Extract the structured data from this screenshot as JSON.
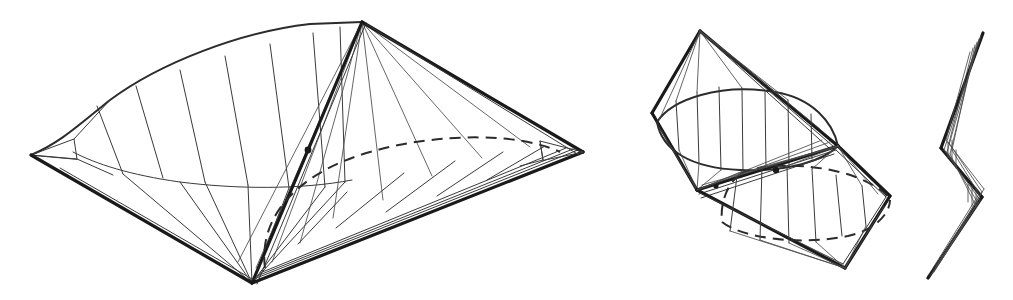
{
  "plate": {
    "title": "Three orthographic views of a flexible polyhedral surface",
    "background_color": "#ffffff",
    "ink_color": "#1a1a1a",
    "width": 1013,
    "height": 300,
    "figure_count": 3,
    "caption": ""
  },
  "figures": [
    {
      "id": "figure-left",
      "name": "perspective-view",
      "label": "",
      "description": "Large three-quarter perspective view of a saddle-shaped polyhedral surface with four corner vertices, ruled meridian lines and a hidden dashed ellipse",
      "bounds": {
        "x": 20,
        "y": 10,
        "width": 580,
        "height": 285
      },
      "vertices": {
        "apex_top": {
          "x": 362,
          "y": 22
        },
        "tip_left": {
          "x": 31,
          "y": 155
        },
        "tip_right": {
          "x": 583,
          "y": 152
        },
        "apex_bottom": {
          "x": 252,
          "y": 283
        }
      },
      "marker_node": {
        "x": 308,
        "y": 150,
        "radius": 3.4
      },
      "ruling_count": 7,
      "hidden_curve": "dashed-ellipse"
    },
    {
      "id": "figure-middle",
      "name": "rotated-view",
      "label": "",
      "description": "Medium rotated view showing two opposed conical lobes joined at a central ridge, each capped by an ellipse, the lower one hidden and dashed",
      "bounds": {
        "x": 640,
        "y": 25,
        "width": 255,
        "height": 250
      },
      "vertices": {
        "apex_top": {
          "x": 700,
          "y": 31
        },
        "tip_left": {
          "x": 652,
          "y": 113
        },
        "node_upper": {
          "x": 697,
          "y": 190
        },
        "node_lower": {
          "x": 838,
          "y": 146
        },
        "tip_right": {
          "x": 890,
          "y": 196
        },
        "apex_bottom": {
          "x": 845,
          "y": 268
        }
      },
      "marker_node": {
        "x": 776,
        "y": 170,
        "radius": 3.2
      },
      "ruling_count": 7,
      "hidden_curve": "dashed-ellipse"
    },
    {
      "id": "figure-right",
      "name": "edge-on-view",
      "label": "",
      "description": "Narrow edge-on profile view collapsing to a zig-zag S shaped sheaf of nearly coincident lines",
      "bounds": {
        "x": 915,
        "y": 30,
        "width": 80,
        "height": 250
      },
      "vertices": {
        "tip_top": {
          "x": 983,
          "y": 33
        },
        "kink_upper": {
          "x": 941,
          "y": 148
        },
        "kink_lower": {
          "x": 982,
          "y": 197
        },
        "tip_bottom": {
          "x": 928,
          "y": 278
        }
      },
      "ruling_count": 6,
      "hidden_curve": "none"
    }
  ],
  "style": {
    "line_color": "#1a1a1a",
    "thin_line_color": "#3a3a3a",
    "dashed_line_color": "#2b2b2b",
    "background_color": "#ffffff",
    "thick_stroke_width": 3.2,
    "thin_stroke_width": 1.0,
    "dash_pattern": "11 7"
  }
}
